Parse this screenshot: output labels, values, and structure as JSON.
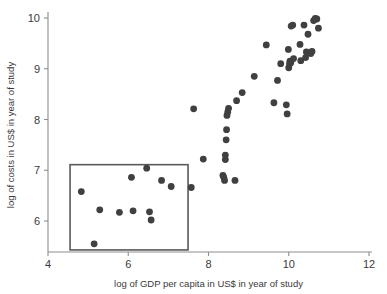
{
  "chart_data": {
    "type": "scatter",
    "title": "",
    "xlabel": "log of GDP per capita in US$ in year of study",
    "ylabel": "log of costs in US$ in year of study",
    "xlim": [
      4,
      12
    ],
    "ylim": [
      5.4,
      10.1
    ],
    "xticks": [
      4,
      6,
      8,
      10,
      12
    ],
    "yticks": [
      6,
      7,
      8,
      9,
      10
    ],
    "xtick_labels": [
      "4",
      "6",
      "8",
      "10",
      "12"
    ],
    "ytick_labels": [
      "6",
      "7",
      "8",
      "9",
      "10"
    ],
    "grid": false,
    "legend": "none",
    "marker": "filled-circle",
    "marker_color": "#404040",
    "marker_size_px": 3.4,
    "annotations": [
      {
        "type": "rectangle",
        "name": "low-income-highlight-box",
        "x0": 4.55,
        "x1": 7.49,
        "y0": 5.43,
        "y1": 7.11,
        "stroke": "#5a5a5a"
      }
    ],
    "points": [
      {
        "x": 4.83,
        "y": 6.58
      },
      {
        "x": 5.15,
        "y": 5.55
      },
      {
        "x": 5.29,
        "y": 6.22
      },
      {
        "x": 5.78,
        "y": 6.17
      },
      {
        "x": 6.08,
        "y": 6.86
      },
      {
        "x": 6.12,
        "y": 6.2
      },
      {
        "x": 6.46,
        "y": 7.04
      },
      {
        "x": 6.53,
        "y": 6.18
      },
      {
        "x": 6.57,
        "y": 6.02
      },
      {
        "x": 6.83,
        "y": 6.8
      },
      {
        "x": 7.07,
        "y": 6.68
      },
      {
        "x": 7.57,
        "y": 6.66
      },
      {
        "x": 7.63,
        "y": 8.21
      },
      {
        "x": 7.87,
        "y": 7.22
      },
      {
        "x": 8.36,
        "y": 6.9
      },
      {
        "x": 8.38,
        "y": 6.86
      },
      {
        "x": 8.4,
        "y": 6.8
      },
      {
        "x": 8.42,
        "y": 7.21
      },
      {
        "x": 8.42,
        "y": 7.3
      },
      {
        "x": 8.44,
        "y": 7.6
      },
      {
        "x": 8.45,
        "y": 7.8
      },
      {
        "x": 8.46,
        "y": 8.08
      },
      {
        "x": 8.48,
        "y": 8.15
      },
      {
        "x": 8.5,
        "y": 8.22
      },
      {
        "x": 8.66,
        "y": 6.8
      },
      {
        "x": 8.7,
        "y": 8.37
      },
      {
        "x": 8.84,
        "y": 8.53
      },
      {
        "x": 9.14,
        "y": 8.85
      },
      {
        "x": 9.44,
        "y": 9.47
      },
      {
        "x": 9.63,
        "y": 8.33
      },
      {
        "x": 9.72,
        "y": 8.77
      },
      {
        "x": 9.8,
        "y": 9.1
      },
      {
        "x": 9.94,
        "y": 8.29
      },
      {
        "x": 9.96,
        "y": 8.11
      },
      {
        "x": 9.99,
        "y": 9.38
      },
      {
        "x": 10.0,
        "y": 9.02
      },
      {
        "x": 10.02,
        "y": 9.1
      },
      {
        "x": 10.03,
        "y": 9.15
      },
      {
        "x": 10.05,
        "y": 9.12
      },
      {
        "x": 10.06,
        "y": 9.84
      },
      {
        "x": 10.1,
        "y": 9.86
      },
      {
        "x": 10.12,
        "y": 9.2
      },
      {
        "x": 10.28,
        "y": 9.48
      },
      {
        "x": 10.3,
        "y": 9.16
      },
      {
        "x": 10.38,
        "y": 9.86
      },
      {
        "x": 10.42,
        "y": 9.22
      },
      {
        "x": 10.44,
        "y": 9.33
      },
      {
        "x": 10.48,
        "y": 9.68
      },
      {
        "x": 10.55,
        "y": 9.3
      },
      {
        "x": 10.58,
        "y": 9.34
      },
      {
        "x": 10.62,
        "y": 9.95
      },
      {
        "x": 10.66,
        "y": 9.99
      },
      {
        "x": 10.7,
        "y": 9.98
      },
      {
        "x": 10.74,
        "y": 9.8
      }
    ]
  }
}
